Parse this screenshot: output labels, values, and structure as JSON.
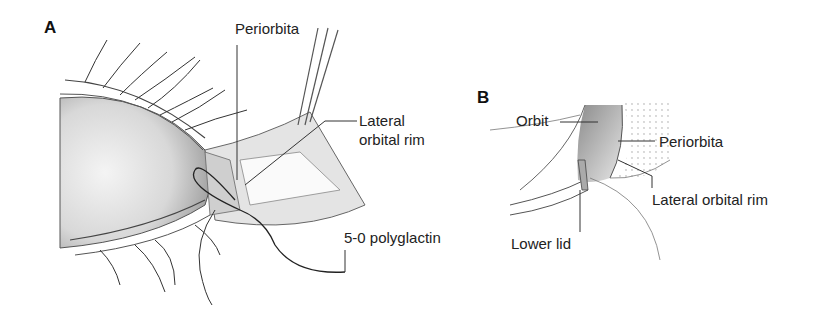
{
  "figure": {
    "panels": [
      {
        "id": "A",
        "letter": "A",
        "labels": {
          "periorbita": "Periorbita",
          "lateral_orbital_rim_line1": "Lateral",
          "lateral_orbital_rim_line2": "orbital rim",
          "suture": "5-0 polyglactin"
        }
      },
      {
        "id": "B",
        "letter": "B",
        "labels": {
          "orbit": "Orbit",
          "periorbita": "Periorbita",
          "lateral_orbital_rim": "Lateral orbital rim",
          "lower_lid": "Lower lid"
        }
      }
    ]
  }
}
